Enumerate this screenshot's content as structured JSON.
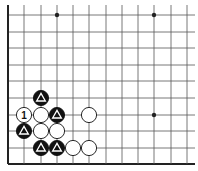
{
  "diagram": {
    "type": "go-board-fragment",
    "grid": {
      "x_lines": [
        8,
        24,
        41,
        57,
        73,
        89,
        106,
        122,
        138,
        154,
        171,
        187
      ],
      "y_lines": [
        15,
        32,
        48,
        65,
        81,
        98,
        115,
        131,
        148,
        164
      ],
      "right_extend_to": 195,
      "top_extend_to": 5,
      "edges": [
        "left",
        "bottom"
      ]
    },
    "star_points": [
      {
        "col": 3,
        "row": 0
      },
      {
        "col": 9,
        "row": 0
      },
      {
        "col": 9,
        "row": 6
      }
    ],
    "stones": [
      {
        "color": "black",
        "col": 2,
        "row": 5,
        "mark": "triangle"
      },
      {
        "color": "white",
        "col": 1,
        "row": 6,
        "label": "1"
      },
      {
        "color": "white",
        "col": 2,
        "row": 6
      },
      {
        "color": "black",
        "col": 3,
        "row": 6,
        "mark": "triangle"
      },
      {
        "color": "white",
        "col": 5,
        "row": 6
      },
      {
        "color": "black",
        "col": 1,
        "row": 7,
        "mark": "triangle"
      },
      {
        "color": "white",
        "col": 2,
        "row": 7
      },
      {
        "color": "white",
        "col": 3,
        "row": 7
      },
      {
        "color": "black",
        "col": 2,
        "row": 8,
        "mark": "triangle"
      },
      {
        "color": "black",
        "col": 3,
        "row": 8,
        "mark": "triangle"
      },
      {
        "color": "white",
        "col": 4,
        "row": 8
      },
      {
        "color": "white",
        "col": 5,
        "row": 8
      }
    ],
    "colors": {
      "line": "#555555",
      "edge": "#222222",
      "black_stone": "#111111",
      "white_stone": "#ffffff",
      "mark_on_black": "#ffffff",
      "label_on_white": "#111111"
    }
  }
}
